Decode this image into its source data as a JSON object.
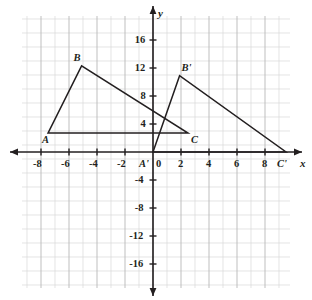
{
  "figure": {
    "colors": {
      "grid_minor": "#d8d8d8",
      "grid_major": "#b8b8b8",
      "axis": "#231f20",
      "shape_stroke": "#231f20",
      "background": "#ffffff",
      "text": "#231f20"
    },
    "axes": {
      "x_label": "x",
      "y_label": "y",
      "origin_label": "0",
      "x_ticks": [
        "-8",
        "-6",
        "-4",
        "-2",
        "2",
        "4",
        "6",
        "8"
      ],
      "y_ticks": [
        "16",
        "12",
        "8",
        "4",
        "-4",
        "-8",
        "-12",
        "-16"
      ],
      "x_min": -9.5,
      "x_max": 9.8,
      "y_min": -19.5,
      "y_max": 19.5,
      "grid_on": true,
      "tick_step": 2
    },
    "vertex_labels": {
      "a": "A",
      "b": "B",
      "c": "C",
      "a_prime": "A'",
      "b_prime": "B'",
      "c_prime": "C'"
    }
  },
  "chart_data": {
    "type": "scatter",
    "xlabel": "x",
    "ylabel": "y",
    "xlim": [
      -9.5,
      9.8
    ],
    "ylim": [
      -19.5,
      19.5
    ],
    "grid": true,
    "x_ticks": [
      -8,
      -6,
      -4,
      -2,
      0,
      2,
      4,
      6,
      8
    ],
    "y_ticks": [
      16,
      12,
      8,
      4,
      0,
      -4,
      -8,
      -12,
      -16
    ],
    "series": [
      {
        "name": "Triangle ABC",
        "closed": true,
        "points": [
          {
            "label": "A",
            "x": -7.5,
            "y": 2.7
          },
          {
            "label": "B",
            "x": -5.1,
            "y": 12.3
          },
          {
            "label": "C",
            "x": 2.5,
            "y": 2.7
          }
        ]
      },
      {
        "name": "Triangle A'B'C'",
        "closed": true,
        "points": [
          {
            "label": "A'",
            "x": 0,
            "y": 0
          },
          {
            "label": "B'",
            "x": 1.9,
            "y": 10.9
          },
          {
            "label": "C'",
            "x": 9.5,
            "y": 0
          }
        ]
      }
    ],
    "annotations": [
      {
        "text": "A",
        "x": -7.5,
        "y": 2.7,
        "placement": "below-left"
      },
      {
        "text": "B",
        "x": -5.1,
        "y": 12.3,
        "placement": "above-left"
      },
      {
        "text": "C",
        "x": 2.5,
        "y": 2.7,
        "placement": "below-right"
      },
      {
        "text": "A'",
        "x": 0,
        "y": 0,
        "placement": "below-left"
      },
      {
        "text": "B'",
        "x": 1.9,
        "y": 10.9,
        "placement": "above-right"
      },
      {
        "text": "C'",
        "x": 9.5,
        "y": 0,
        "placement": "below-left"
      }
    ]
  }
}
